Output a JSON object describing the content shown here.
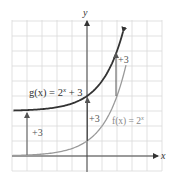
{
  "chart_data": {
    "type": "line",
    "title": "",
    "xlabel": "x",
    "ylabel": "y",
    "xlim": [
      -5,
      5
    ],
    "ylim": [
      -1,
      9
    ],
    "grid": true,
    "grid_step": 1,
    "legend": "inline labels",
    "series": [
      {
        "name": "g(x) = 2^x + 3",
        "label": "g(x) = 2",
        "label_sup": "x",
        "label_tail": " + 3",
        "color": "#333333",
        "x": [
          -5,
          -4,
          -3,
          -2,
          -1,
          0,
          1,
          2,
          2.4
        ],
        "values": [
          3.03,
          3.06,
          3.13,
          3.25,
          3.5,
          4,
          5,
          7,
          8.28
        ]
      },
      {
        "name": "f(x) = 2^x",
        "label": "f(x) = 2",
        "label_sup": "x",
        "color": "#9a9a9a",
        "x": [
          -5,
          -4,
          -3,
          -2,
          -1,
          0,
          1,
          2,
          2.6
        ],
        "values": [
          0.03,
          0.06,
          0.13,
          0.25,
          0.5,
          1,
          2,
          4,
          6.06
        ]
      }
    ],
    "annotations": [
      {
        "type": "arrow",
        "x": -4,
        "from": 0.06,
        "to": 3.06,
        "label": "+3"
      },
      {
        "type": "arrow",
        "x": 0,
        "from": 1,
        "to": 4,
        "label": "+3"
      },
      {
        "type": "arrow",
        "x": 2,
        "from": 4,
        "to": 7,
        "label": "+3"
      }
    ]
  },
  "labels": {
    "x_axis": "x",
    "y_axis": "y",
    "g_main": "g(x) = 2",
    "g_sup": "x",
    "g_tail": " + 3",
    "f_main": "f(x) = 2",
    "f_sup": "x",
    "shift_left": "+3",
    "shift_mid": "+3",
    "shift_right": "+3"
  }
}
